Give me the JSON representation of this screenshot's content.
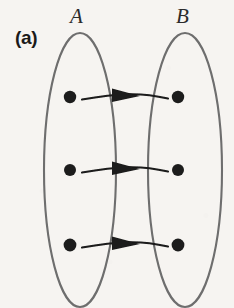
{
  "figure": {
    "panel_label": "(a)",
    "caption_kind": "set-mapping-diagram",
    "background_color": "#f6f4f1",
    "ink_color": "#1a1a1a",
    "outline_color": "#6e6e6e",
    "rule_color": "#8f8f8f"
  },
  "sets": {
    "left": {
      "label": "A",
      "ellipse": {
        "cx": 80,
        "cy": 170,
        "rx": 36,
        "ry": 137
      },
      "elements": [
        {
          "id": "a1",
          "cx": 70,
          "cy": 97,
          "r": 6
        },
        {
          "id": "a2",
          "cx": 70,
          "cy": 170,
          "r": 6
        },
        {
          "id": "a3",
          "cx": 70,
          "cy": 245,
          "r": 6
        }
      ]
    },
    "right": {
      "label": "B",
      "ellipse": {
        "cx": 185,
        "cy": 170,
        "rx": 37,
        "ry": 137
      },
      "elements": [
        {
          "id": "b1",
          "cx": 178,
          "cy": 97,
          "r": 6
        },
        {
          "id": "b2",
          "cx": 178,
          "cy": 170,
          "r": 6
        },
        {
          "id": "b3",
          "cx": 178,
          "cy": 245,
          "r": 6
        }
      ]
    }
  },
  "mappings": {
    "count": 3,
    "arrows": [
      {
        "from": "a1",
        "to": "b1",
        "x1": 82,
        "x2": 168,
        "y": 97,
        "head_x": 130
      },
      {
        "from": "a2",
        "to": "b2",
        "x1": 82,
        "x2": 168,
        "y": 170,
        "head_x": 130
      },
      {
        "from": "a3",
        "to": "b3",
        "x1": 82,
        "x2": 168,
        "y": 245,
        "head_x": 130
      }
    ]
  },
  "margin_rule": {
    "x": 10,
    "y1": 0,
    "y2": 308
  }
}
